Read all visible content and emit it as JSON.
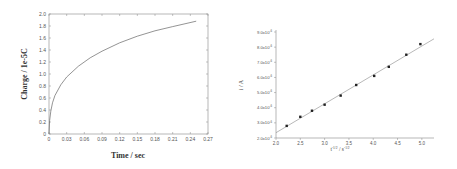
{
  "chart_data": [
    {
      "type": "line",
      "title": "",
      "xlabel": "Time / sec",
      "ylabel": "Charge / 1e-5C",
      "xlim": [
        0,
        0.27
      ],
      "ylim": [
        0,
        2.0
      ],
      "x_ticks": [
        "0",
        "0.03",
        "0.06",
        "0.09",
        "0.12",
        "0.15",
        "0.18",
        "0.21",
        "0.24",
        "0.27"
      ],
      "y_ticks": [
        "0",
        "0.2",
        "0.4",
        "0.6",
        "0.8",
        "1.0",
        "1.2",
        "1.4",
        "1.6",
        "1.8",
        "2.0"
      ],
      "grid": false,
      "legend": null,
      "series": [
        {
          "name": "charge",
          "x": [
            0,
            0.001,
            0.003,
            0.006,
            0.01,
            0.02,
            0.03,
            0.05,
            0.07,
            0.09,
            0.12,
            0.15,
            0.18,
            0.21,
            0.25
          ],
          "values": [
            0,
            0.22,
            0.38,
            0.52,
            0.64,
            0.82,
            0.95,
            1.13,
            1.27,
            1.38,
            1.52,
            1.63,
            1.72,
            1.79,
            1.88
          ]
        }
      ]
    },
    {
      "type": "scatter",
      "title": "",
      "xlabel": "t^-1/2 / s^-1/2",
      "ylabel": "i / A",
      "xlim": [
        2.0,
        5.25
      ],
      "ylim": [
        2.0,
        9.0
      ],
      "x_ticks": [
        "2.0",
        "2.5",
        "3.0",
        "3.5",
        "4.0",
        "4.5",
        "5.0"
      ],
      "y_ticks": [
        "2.0x10",
        "3.0x10",
        "4.0x10",
        "5.0x10",
        "6.0x10",
        "7.0x10",
        "8.0x10",
        "9.0x10"
      ],
      "y_tick_exponent": "-6",
      "grid": false,
      "legend": null,
      "series": [
        {
          "name": "measured",
          "x": [
            2.22,
            2.5,
            2.74,
            3.0,
            3.33,
            3.65,
            4.02,
            4.32,
            4.68,
            4.97
          ],
          "values": [
            2.8,
            3.4,
            3.8,
            4.2,
            4.8,
            5.5,
            6.1,
            6.7,
            7.5,
            8.2
          ]
        },
        {
          "name": "linear fit",
          "x": [
            2.0,
            5.25
          ],
          "values": [
            2.35,
            8.55
          ]
        }
      ]
    }
  ],
  "left": {
    "xlabel": "Time / sec",
    "ylabel": "Charge / 1e-5C",
    "x_ticks": [
      "0",
      "0.03",
      "0.06",
      "0.09",
      "0.12",
      "0.15",
      "0.18",
      "0.21",
      "0.24",
      "0.27"
    ],
    "y_ticks": [
      "0",
      "0.2",
      "0.4",
      "0.6",
      "0.8",
      "1.0",
      "1.2",
      "1.4",
      "1.6",
      "1.8",
      "2.0"
    ]
  },
  "right": {
    "xlabel_base": "t",
    "xlabel_sup": "-1/2",
    "xlabel_unit": " / s",
    "xlabel_unit_sup": "-1/2",
    "ylabel": "i / A",
    "x_ticks": [
      "2.0",
      "2.5",
      "3.0",
      "3.5",
      "4.0",
      "4.5",
      "5.0"
    ],
    "y_ticks": [
      "2.0x10",
      "3.0x10",
      "4.0x10",
      "5.0x10",
      "6.0x10",
      "7.0x10",
      "8.0x10",
      "9.0x10"
    ],
    "y_exp": "-6"
  },
  "colors": {
    "axis": "#777777",
    "curve": "#666666",
    "marker": "#222222",
    "fit": "#888888"
  }
}
